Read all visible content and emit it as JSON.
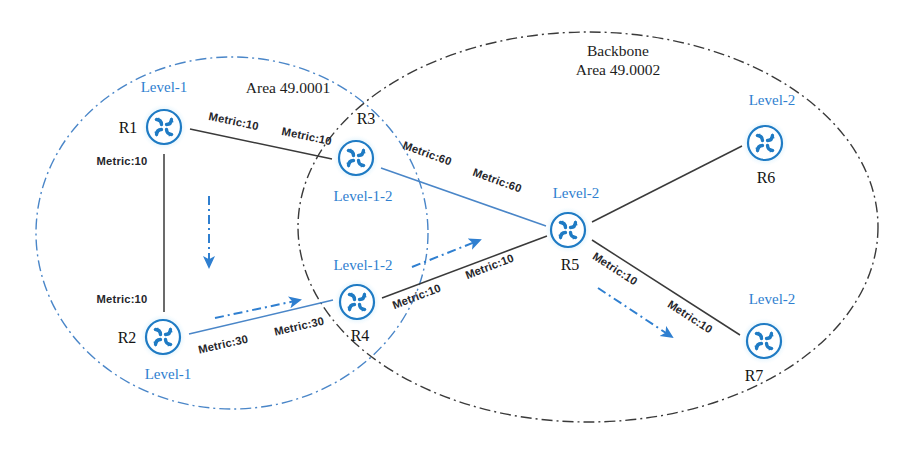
{
  "diagram": {
    "colors": {
      "accent_blue": "#2f7fd0",
      "router_stroke": "#1f7bc4",
      "router_glow": "#a9dcf7",
      "line_black": "#3a3a3a",
      "line_blue": "#4a86c8"
    },
    "areas": [
      {
        "id": "area-49-0001",
        "label_line1": "",
        "label_line2": "Area 49.0001",
        "style": "blue-dash-dot",
        "cx": 232,
        "cy": 233,
        "rx": 196,
        "ry": 176,
        "label_x": 288,
        "label_y": 93
      },
      {
        "id": "area-49-0002",
        "label_line1": "Backbone",
        "label_line2": "Area 49.0002",
        "style": "black-dash-dot",
        "cx": 588,
        "cy": 227,
        "rx": 290,
        "ry": 195,
        "label_x": 618,
        "label_y": 56
      }
    ],
    "routers": [
      {
        "id": "r1",
        "name": "R1",
        "level": "Level-1",
        "x": 164,
        "y": 127,
        "name_x": 128,
        "name_y": 133,
        "level_x": 164,
        "level_y": 92
      },
      {
        "id": "r2",
        "name": "R2",
        "level": "Level-1",
        "x": 163,
        "y": 337,
        "name_x": 127,
        "name_y": 343,
        "level_x": 168,
        "level_y": 379
      },
      {
        "id": "r3",
        "name": "R3",
        "level": "Level-1-2",
        "x": 356,
        "y": 158,
        "name_x": 366,
        "name_y": 124,
        "level_x": 363,
        "level_y": 201
      },
      {
        "id": "r4",
        "name": "R4",
        "level": "Level-1-2",
        "x": 357,
        "y": 302,
        "name_x": 360,
        "name_y": 341,
        "level_x": 363,
        "level_y": 270
      },
      {
        "id": "r5",
        "name": "R5",
        "level": "Level-2",
        "x": 568,
        "y": 230,
        "name_x": 570,
        "name_y": 270,
        "level_x": 576,
        "level_y": 198
      },
      {
        "id": "r6",
        "name": "R6",
        "level": "Level-2",
        "x": 765,
        "y": 143,
        "name_x": 766,
        "name_y": 183,
        "level_x": 772,
        "level_y": 105
      },
      {
        "id": "r7",
        "name": "R7",
        "level": "Level-2",
        "x": 764,
        "y": 341,
        "name_x": 754,
        "name_y": 381,
        "level_x": 772,
        "level_y": 304
      }
    ],
    "links": [
      {
        "id": "link-r1-r3",
        "from": "R1",
        "to": "R3",
        "color": "black",
        "x1": 190,
        "y1": 129,
        "x2": 332,
        "y2": 159
      },
      {
        "id": "link-r1-r2",
        "from": "R1",
        "to": "R2",
        "color": "black",
        "x1": 164,
        "y1": 154,
        "x2": 164,
        "y2": 312
      },
      {
        "id": "link-r2-r4",
        "from": "R2",
        "to": "R4",
        "color": "blue",
        "x1": 189,
        "y1": 334,
        "x2": 333,
        "y2": 300
      },
      {
        "id": "link-r3-r5",
        "from": "R3",
        "to": "R5",
        "color": "blue",
        "x1": 381,
        "y1": 168,
        "x2": 546,
        "y2": 226
      },
      {
        "id": "link-r4-r5",
        "from": "R4",
        "to": "R5",
        "color": "black",
        "x1": 382,
        "y1": 298,
        "x2": 547,
        "y2": 236
      },
      {
        "id": "link-r5-r6",
        "from": "R5",
        "to": "R6",
        "color": "black",
        "x1": 592,
        "y1": 222,
        "x2": 742,
        "y2": 146
      },
      {
        "id": "link-r5-r7",
        "from": "R5",
        "to": "R7",
        "color": "black",
        "x1": 592,
        "y1": 240,
        "x2": 740,
        "y2": 335
      }
    ],
    "metric_labels": [
      {
        "id": "metric-r1-r3-near-r1",
        "text": "Metric:10",
        "x": 233,
        "y": 125,
        "rotate": 12
      },
      {
        "id": "metric-r1-r3-near-r3",
        "text": "Metric:10",
        "x": 306,
        "y": 140,
        "rotate": 12
      },
      {
        "id": "metric-r1-r2-top",
        "text": "Metric:10",
        "x": 122,
        "y": 165,
        "rotate": 0
      },
      {
        "id": "metric-r1-r2-bottom",
        "text": "Metric:10",
        "x": 122,
        "y": 303,
        "rotate": 0
      },
      {
        "id": "metric-r2-r4-near-r2",
        "text": "Metric:30",
        "x": 224,
        "y": 348,
        "rotate": -13
      },
      {
        "id": "metric-r2-r4-near-r4",
        "text": "Metric:30",
        "x": 300,
        "y": 330,
        "rotate": -13
      },
      {
        "id": "metric-r3-r5-near-r3",
        "text": "Metric:60",
        "x": 426,
        "y": 157,
        "rotate": 20
      },
      {
        "id": "metric-r3-r5-near-r5",
        "text": "Metric:60",
        "x": 496,
        "y": 184,
        "rotate": 20
      },
      {
        "id": "metric-r4-r5-near-r4",
        "text": "Metric:10",
        "x": 418,
        "y": 300,
        "rotate": -21
      },
      {
        "id": "metric-r4-r5-near-r5",
        "text": "Metric:10",
        "x": 491,
        "y": 270,
        "rotate": -21
      },
      {
        "id": "metric-r5-r7-near-r5",
        "text": "Metric:10",
        "x": 613,
        "y": 272,
        "rotate": 33
      },
      {
        "id": "metric-r5-r7-near-r7",
        "text": "Metric:10",
        "x": 688,
        "y": 320,
        "rotate": 33
      }
    ],
    "flow_arrows": [
      {
        "id": "flow-r1-to-r2",
        "x1": 209,
        "y1": 196,
        "x2": 209,
        "y2": 267
      },
      {
        "id": "flow-r2-to-r4",
        "x1": 215,
        "y1": 318,
        "x2": 300,
        "y2": 300
      },
      {
        "id": "flow-r4-to-r5",
        "x1": 412,
        "y1": 267,
        "x2": 480,
        "y2": 240
      },
      {
        "id": "flow-r5-to-r7",
        "x1": 598,
        "y1": 288,
        "x2": 672,
        "y2": 337
      }
    ]
  }
}
